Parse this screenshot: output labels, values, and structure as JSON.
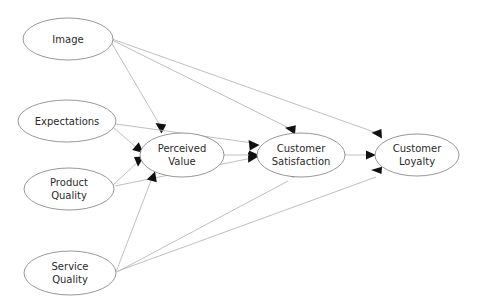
{
  "diagram": {
    "type": "path-diagram",
    "canvas": {
      "width": 480,
      "height": 305
    },
    "background_color": "#ffffff",
    "node_stroke_color": "#8c8c8c",
    "node_fill_color": "#ffffff",
    "edge_color": "#b4b4b4",
    "arrow_color": "#111111",
    "label_color": "#2b2b2b",
    "nodes": [
      {
        "id": "image",
        "label_lines": [
          "Image"
        ],
        "line1": "Image",
        "line2": "",
        "cx": 68,
        "cy": 39,
        "rx": 45,
        "ry": 21
      },
      {
        "id": "expectations",
        "label_lines": [
          "Expectations"
        ],
        "line1": "Expectations",
        "line2": "",
        "cx": 67,
        "cy": 121,
        "rx": 49,
        "ry": 21
      },
      {
        "id": "product-quality",
        "label_lines": [
          "Product",
          "Quality"
        ],
        "line1": "Product",
        "line2": "Quality",
        "cx": 69,
        "cy": 189,
        "rx": 45,
        "ry": 21
      },
      {
        "id": "service-quality",
        "label_lines": [
          "Service",
          "Quality"
        ],
        "line1": "Service",
        "line2": "Quality",
        "cx": 70,
        "cy": 273,
        "rx": 46,
        "ry": 22
      },
      {
        "id": "perceived-value",
        "label_lines": [
          "Perceived",
          "Value"
        ],
        "line1": "Perceived",
        "line2": "Value",
        "cx": 182,
        "cy": 155,
        "rx": 42,
        "ry": 22
      },
      {
        "id": "customer-satisfaction",
        "label_lines": [
          "Customer",
          "Satisfaction"
        ],
        "line1": "Customer",
        "line2": "Satisfaction",
        "cx": 301,
        "cy": 155,
        "rx": 44,
        "ry": 22
      },
      {
        "id": "customer-loyalty",
        "label_lines": [
          "Customer",
          "Loyalty"
        ],
        "line1": "Customer",
        "line2": "Loyalty",
        "cx": 417,
        "cy": 155,
        "rx": 42,
        "ry": 21
      }
    ],
    "edges": [
      {
        "id": "edge-image-perceived-value",
        "from": "image",
        "to": "perceived-value",
        "label": ""
      },
      {
        "id": "edge-image-customer-satisfaction",
        "from": "image",
        "to": "customer-satisfaction",
        "label": ""
      },
      {
        "id": "edge-image-customer-loyalty",
        "from": "image",
        "to": "customer-loyalty",
        "label": ""
      },
      {
        "id": "edge-expectations-perceived-value",
        "from": "expectations",
        "to": "perceived-value",
        "label": ""
      },
      {
        "id": "edge-expectations-customer-satisfaction",
        "from": "expectations",
        "to": "customer-satisfaction",
        "label": ""
      },
      {
        "id": "edge-product-quality-perceived-value",
        "from": "product-quality",
        "to": "perceived-value",
        "label": ""
      },
      {
        "id": "edge-product-quality-customer-satisfaction",
        "from": "product-quality",
        "to": "customer-satisfaction",
        "label": ""
      },
      {
        "id": "edge-service-quality-perceived-value",
        "from": "service-quality",
        "to": "perceived-value",
        "label": ""
      },
      {
        "id": "edge-service-quality-customer-satisfaction",
        "from": "service-quality",
        "to": "customer-satisfaction",
        "label": ""
      },
      {
        "id": "edge-service-quality-customer-loyalty",
        "from": "service-quality",
        "to": "customer-loyalty",
        "label": ""
      },
      {
        "id": "edge-perceived-value-customer-satisfaction",
        "from": "perceived-value",
        "to": "customer-satisfaction",
        "label": ""
      },
      {
        "id": "edge-customer-satisfaction-customer-loyalty",
        "from": "customer-satisfaction",
        "to": "customer-loyalty",
        "label": ""
      }
    ]
  }
}
